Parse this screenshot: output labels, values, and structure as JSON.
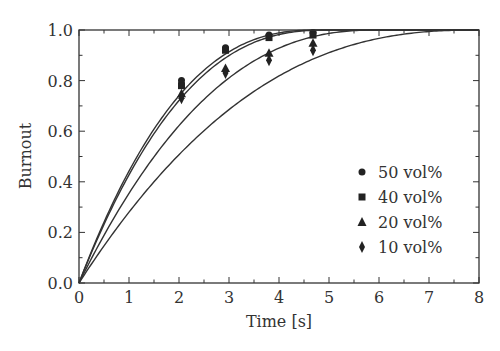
{
  "chart_data": {
    "type": "scatter",
    "title": "",
    "xlabel": "Time [s]",
    "ylabel": "Burnout",
    "xlim": [
      0,
      8
    ],
    "ylim": [
      0.0,
      1.0
    ],
    "x_ticks": [
      "0",
      "1",
      "2",
      "3",
      "4",
      "5",
      "6",
      "7",
      "8"
    ],
    "y_ticks": [
      "0.0",
      "0.2",
      "0.4",
      "0.6",
      "0.8",
      "1.0"
    ],
    "grid": false,
    "legend_position": "lower right",
    "series": [
      {
        "name": "50 vol%",
        "marker": "circle",
        "x": [
          2.05,
          2.93,
          3.8,
          4.68
        ],
        "y": [
          0.8,
          0.93,
          0.98,
          0.99
        ],
        "fit_T": 4.8,
        "fit_n": 2.5
      },
      {
        "name": "40 vol%",
        "marker": "square",
        "x": [
          2.05,
          2.93,
          3.8,
          4.68
        ],
        "y": [
          0.78,
          0.92,
          0.97,
          0.98
        ],
        "fit_T": 5.0,
        "fit_n": 2.5
      },
      {
        "name": "20 vol%",
        "marker": "triangle",
        "x": [
          2.05,
          2.93,
          3.8,
          4.68
        ],
        "y": [
          0.75,
          0.85,
          0.91,
          0.95
        ],
        "fit_T": 6.0,
        "fit_n": 2.4
      },
      {
        "name": "10 vol%",
        "marker": "diamond",
        "x": [
          2.05,
          2.93,
          3.8,
          4.68
        ],
        "y": [
          0.73,
          0.83,
          0.88,
          0.92
        ],
        "fit_T": 8.0,
        "fit_n": 2.46
      }
    ],
    "fit_curves": "B(t) = 1 - (1 - t/T)^n, four model curves"
  },
  "legend": {
    "items": [
      {
        "label": "50 vol%",
        "marker": "circle"
      },
      {
        "label": "40 vol%",
        "marker": "square"
      },
      {
        "label": "20 vol%",
        "marker": "triangle"
      },
      {
        "label": "10 vol%",
        "marker": "diamond"
      }
    ]
  },
  "colors": {
    "line": "#333333",
    "marker": "#222222",
    "axis": "#333333"
  }
}
